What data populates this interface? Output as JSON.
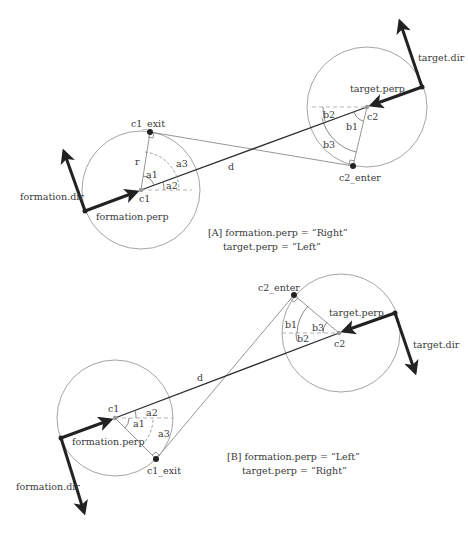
{
  "panels": [
    {
      "id": "A",
      "caption_line1": "[A] formation.perp = “Right”",
      "caption_line2": "target.perp  = “Left”",
      "labels": {
        "c1_exit": "c1_exit",
        "r": "r",
        "a1": "a1",
        "a2": "a2",
        "a3": "a3",
        "c1": "c1",
        "d": "d",
        "formation_dir": "formation.dir",
        "formation_perp": "formation.perp",
        "target_dir": "target.dir",
        "target_perp": "target.perp",
        "c2": "c2",
        "b1": "b1",
        "b2": "b2",
        "b3": "b3",
        "c2_enter": "c2_enter"
      }
    },
    {
      "id": "B",
      "caption_line1": "[B] formation.perp = “Left”",
      "caption_line2": "target.perp = “Right”",
      "labels": {
        "c2_enter": "c2_enter",
        "target_perp": "target.perp",
        "b1": "b1",
        "b2": "b2",
        "b3": "b3",
        "c2": "c2",
        "target_dir": "target.dir",
        "d": "d",
        "c1": "c1",
        "a1": "a1",
        "a2": "a2",
        "a3": "a3",
        "formation_perp": "formation.perp",
        "c1_exit": "c1_exit",
        "formation_dir": "formation.dir"
      }
    }
  ],
  "colors": {
    "heavy_arrow": "#222222",
    "circle": "#9a9a9a",
    "text": "#3a3a3a"
  }
}
